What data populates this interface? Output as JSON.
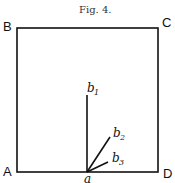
{
  "figure": {
    "caption": "Fig. 4.",
    "corners": {
      "A": "A",
      "B": "B",
      "C": "C",
      "D": "D"
    },
    "origin_point": "a",
    "rays": [
      {
        "label": "b",
        "sub": "1"
      },
      {
        "label": "b",
        "sub": "2"
      },
      {
        "label": "b",
        "sub": "3"
      }
    ]
  }
}
